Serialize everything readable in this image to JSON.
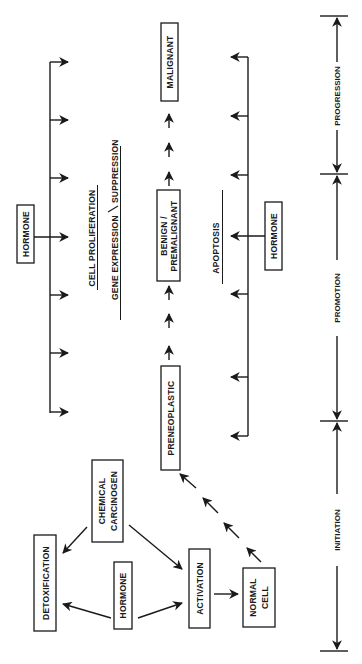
{
  "diagram": {
    "orientation": "rotated-90-ccw",
    "nodes": {
      "hormone_left": "HORMONE",
      "cell_proliferation": "CELL PROLIFERATION",
      "gene_expression": "GENE EXPRESSION",
      "slash": "/",
      "suppression": "SUPPRESSION",
      "malignant": "MALIGNANT",
      "benign_line1": "BENIGN /",
      "benign_line2": "PREMALIGNANT",
      "preneoplastic": "PRENEOPLASTIC",
      "apoptosis": "APOPTOSIS",
      "hormone_right": "HORMONE",
      "chemical_line1": "CHEMICAL",
      "chemical_line2": "CARCINOGEN",
      "detoxification": "DETOXIFICATION",
      "hormone_bottom": "HORMONE",
      "activation": "ACTIVATION",
      "normal_line1": "NORMAL",
      "normal_line2": "CELL"
    },
    "stages": {
      "progression": "PROGRESSION",
      "promotion": "PROMOTION",
      "initiation": "INITIATION"
    },
    "edges": [
      {
        "from": "CHEMICAL CARCINOGEN",
        "to": "DETOXIFICATION"
      },
      {
        "from": "CHEMICAL CARCINOGEN",
        "to": "ACTIVATION"
      },
      {
        "from": "HORMONE",
        "to": "DETOXIFICATION"
      },
      {
        "from": "HORMONE",
        "to": "ACTIVATION"
      },
      {
        "from": "ACTIVATION",
        "to": "NORMAL CELL"
      },
      {
        "from": "NORMAL CELL",
        "to": "PRENEOPLASTIC",
        "style": "dashed"
      },
      {
        "from": "PRENEOPLASTIC",
        "to": "BENIGN/PREMALIGNANT",
        "style": "dashed"
      },
      {
        "from": "BENIGN/PREMALIGNANT",
        "to": "MALIGNANT",
        "style": "dashed"
      },
      {
        "from": "HORMONE",
        "to": "CELL PROLIFERATION / GENE EXPRESSION/SUPPRESSION"
      },
      {
        "from": "HORMONE",
        "to": "APOPTOSIS"
      }
    ]
  }
}
